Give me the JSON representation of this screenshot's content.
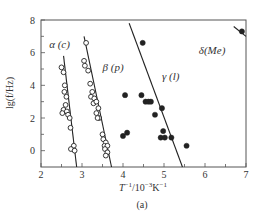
{
  "chart_data": {
    "type": "scatter",
    "title": "",
    "panel_label": "(a)",
    "xlabel": "T^-1/10^-3K^-1",
    "ylabel": "lg(f/Hz)",
    "xlim": [
      2,
      7
    ],
    "ylim": [
      -1,
      8
    ],
    "xticks": [
      2,
      3,
      4,
      5,
      6,
      7
    ],
    "yticks": [
      0,
      2,
      4,
      6,
      8
    ],
    "grid": false,
    "colors": {
      "ink": "#222222",
      "frame": "#555555"
    },
    "series": [
      {
        "name": "α (c)",
        "marker": "open-circle",
        "points": [
          [
            2.5,
            5.1
          ],
          [
            2.55,
            4.8
          ],
          [
            2.58,
            4.0
          ],
          [
            2.57,
            3.6
          ],
          [
            2.62,
            3.3
          ],
          [
            2.6,
            2.8
          ],
          [
            2.55,
            2.5
          ],
          [
            2.63,
            2.4
          ],
          [
            2.66,
            2.2
          ],
          [
            2.7,
            2.0
          ],
          [
            2.52,
            2.3
          ],
          [
            2.72,
            1.4
          ],
          [
            2.8,
            0.3
          ],
          [
            2.73,
            0.1
          ],
          [
            2.82,
            0.0
          ]
        ],
        "fit_line": [
          [
            2.55,
            5.8
          ],
          [
            2.87,
            -1.0
          ]
        ]
      },
      {
        "name": "β (p)",
        "marker": "open-circle",
        "points": [
          [
            3.1,
            6.6
          ],
          [
            3.05,
            5.5
          ],
          [
            3.07,
            5.2
          ],
          [
            3.15,
            4.9
          ],
          [
            3.2,
            4.1
          ],
          [
            3.25,
            3.6
          ],
          [
            3.22,
            3.3
          ],
          [
            3.3,
            3.2
          ],
          [
            3.28,
            2.9
          ],
          [
            3.35,
            3.0
          ],
          [
            3.4,
            2.6
          ],
          [
            3.35,
            2.3
          ],
          [
            3.42,
            2.0
          ],
          [
            3.38,
            2.0
          ],
          [
            3.5,
            1.0
          ],
          [
            3.52,
            0.7
          ],
          [
            3.58,
            0.5
          ],
          [
            3.55,
            0.3
          ],
          [
            3.62,
            0.3
          ],
          [
            3.56,
            0.1
          ],
          [
            3.62,
            -0.1
          ],
          [
            3.58,
            -0.3
          ]
        ],
        "fit_line": [
          [
            3.05,
            7.0
          ],
          [
            3.72,
            -1.0
          ]
        ]
      },
      {
        "name": "γ (l)",
        "marker": "filled-circle",
        "points": [
          [
            4.48,
            6.6
          ],
          [
            4.05,
            3.4
          ],
          [
            4.45,
            3.4
          ],
          [
            4.55,
            3.0
          ],
          [
            4.62,
            3.0
          ],
          [
            4.68,
            3.0
          ],
          [
            4.95,
            2.6
          ],
          [
            4.78,
            2.2
          ],
          [
            4.0,
            0.9
          ],
          [
            4.1,
            1.1
          ],
          [
            4.98,
            1.2
          ],
          [
            4.92,
            0.8
          ],
          [
            5.02,
            0.8
          ],
          [
            5.18,
            0.8
          ],
          [
            5.55,
            0.3
          ]
        ],
        "fit_line": [
          [
            4.15,
            7.8
          ],
          [
            5.45,
            -1.0
          ]
        ]
      },
      {
        "name": "δ(Me)",
        "marker": "filled-circle",
        "points": [
          [
            6.9,
            7.3
          ]
        ],
        "fit_line": [
          [
            6.7,
            7.6
          ],
          [
            7.0,
            7.0
          ]
        ]
      }
    ],
    "annotations": [
      {
        "text": "α (c)",
        "x": 2.2,
        "y": 6.3
      },
      {
        "text": "β (p)",
        "x": 3.5,
        "y": 4.9
      },
      {
        "text": "γ (l)",
        "x": 4.95,
        "y": 4.3
      },
      {
        "text": "δ(Me)",
        "x": 5.85,
        "y": 5.9
      }
    ]
  }
}
